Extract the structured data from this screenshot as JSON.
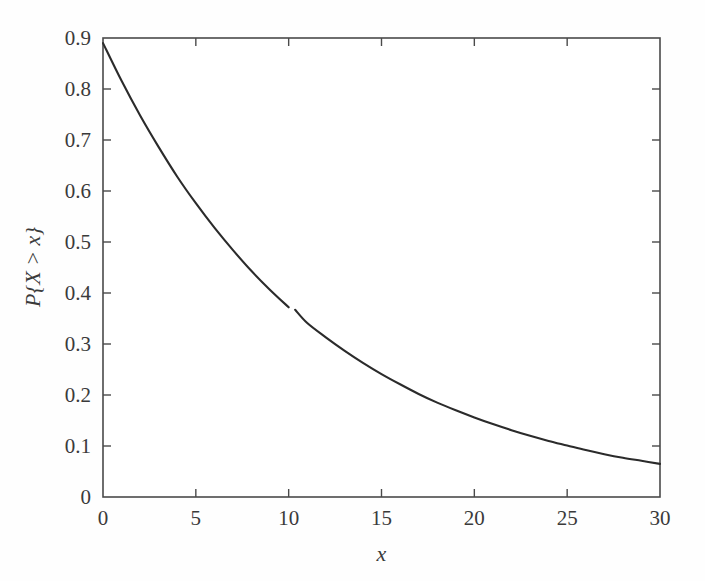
{
  "figure": {
    "background_color": "#fefefe",
    "curve_color": "#2b2b2b",
    "axis_color": "#4a4a4a"
  },
  "chart_data": {
    "type": "line",
    "title": "",
    "subtitle": "",
    "xlabel": "x",
    "ylabel": "P{X > x}",
    "xlim": [
      0,
      30
    ],
    "ylim": [
      0,
      0.9
    ],
    "grid": false,
    "legend": null,
    "legend_position": "none",
    "x_ticks": [
      0,
      5,
      10,
      15,
      20,
      25,
      30
    ],
    "x_tick_labels": [
      "0",
      "5",
      "10",
      "15",
      "20",
      "25",
      "30"
    ],
    "y_ticks": [
      0,
      0.1,
      0.2,
      0.3,
      0.4,
      0.5,
      0.6,
      0.7,
      0.8,
      0.9
    ],
    "y_tick_labels": [
      "0",
      "0.1",
      "0.2",
      "0.3",
      "0.4",
      "0.5",
      "0.6",
      "0.7",
      "0.8",
      "0.9"
    ],
    "tick_direction": "in",
    "series": [
      {
        "name": "P{X > x}",
        "x": [
          0,
          1,
          2,
          3,
          4,
          5,
          6,
          7,
          8,
          9,
          10,
          11,
          12,
          13,
          14,
          15,
          16,
          17,
          18,
          19,
          20,
          21,
          22,
          23,
          24,
          25,
          26,
          27,
          28,
          29,
          30
        ],
        "values": [
          0.89,
          0.816,
          0.748,
          0.686,
          0.628,
          0.576,
          0.528,
          0.484,
          0.443,
          0.406,
          0.372,
          0.341,
          0.313,
          0.287,
          0.263,
          0.241,
          0.221,
          0.202,
          0.185,
          0.17,
          0.156,
          0.143,
          0.131,
          0.12,
          0.11,
          0.101,
          0.092,
          0.084,
          0.077,
          0.071,
          0.065
        ]
      }
    ],
    "annotations": [
      {
        "name": "curve-break-artifact",
        "x": 10.1,
        "y": 0.371,
        "note": "small gap in plotted line"
      }
    ]
  },
  "axes": {
    "y_label_text": "P{X > x}",
    "x_label_text": "x"
  }
}
